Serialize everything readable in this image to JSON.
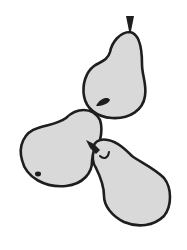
{
  "illustration": {
    "subject": "three pears",
    "colors": {
      "background": "#ffffff",
      "fill": "#d9d9d9",
      "outline": "#1e1e1e"
    },
    "items": [
      {
        "name": "pear-top-right"
      },
      {
        "name": "pear-left"
      },
      {
        "name": "pear-bottom-right"
      }
    ]
  }
}
